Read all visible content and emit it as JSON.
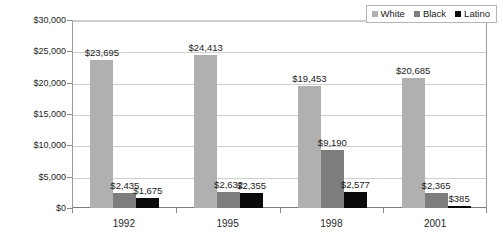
{
  "chart_data": {
    "type": "bar",
    "title": "",
    "subtitle": "",
    "xlabel": "",
    "ylabel": "",
    "categories": [
      "1992",
      "1995",
      "1998",
      "2001"
    ],
    "series": [
      {
        "name": "White",
        "color": "#b0b0b0",
        "values": [
          23695,
          24413,
          19453,
          20685
        ],
        "labels": [
          "$23,695",
          "$24,413",
          "$19,453",
          "$20,685"
        ]
      },
      {
        "name": "Black",
        "color": "#7d7d7d",
        "values": [
          2435,
          2632,
          9190,
          2365
        ],
        "labels": [
          "$2,435",
          "$2,632",
          "$9,190",
          "$2,365"
        ]
      },
      {
        "name": "Latino",
        "color": "#0a0a0a",
        "values": [
          1675,
          2355,
          2577,
          385
        ],
        "labels": [
          "$1,675",
          "$2,355",
          "$2,577",
          "$385"
        ]
      }
    ],
    "ylim": [
      0,
      30000
    ],
    "ytick_values": [
      0,
      5000,
      10000,
      15000,
      20000,
      25000,
      30000
    ],
    "ytick_labels": [
      "$0",
      "$5,000",
      "$10,000",
      "$15,000",
      "$20,000",
      "$25,000",
      "$30,000"
    ],
    "grid": true,
    "legend_position": "top-right",
    "background": "#ffffff"
  },
  "legend": {
    "items": [
      {
        "label": "White",
        "color": "#b0b0b0"
      },
      {
        "label": "Black",
        "color": "#7d7d7d"
      },
      {
        "label": "Latino",
        "color": "#0a0a0a"
      }
    ]
  }
}
